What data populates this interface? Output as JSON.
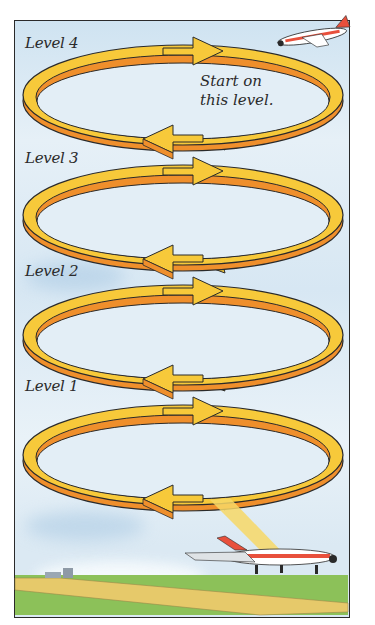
{
  "diagram": {
    "type": "holding-pattern-illustration",
    "levels": [
      {
        "id": 4,
        "label": "Level 4"
      },
      {
        "id": 3,
        "label": "Level 3"
      },
      {
        "id": 2,
        "label": "Level 2"
      },
      {
        "id": 1,
        "label": "Level 1"
      }
    ],
    "annotation": {
      "line1": "Start on",
      "line2": "this level."
    },
    "colors": {
      "ring_top": "#f7c93a",
      "ring_side": "#ef8f2c",
      "outline": "#2a2a2a",
      "sky": "#d7e7f3",
      "grass": "#8cc159",
      "runway": "#e6c96a",
      "plane_stripe": "#e8503c"
    },
    "elements": [
      "airplane-in-flight",
      "airplane-landing",
      "runway",
      "airport-buildings"
    ]
  }
}
